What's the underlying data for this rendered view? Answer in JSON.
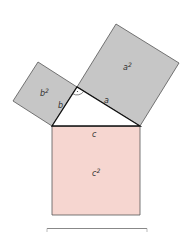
{
  "diagram": {
    "colors": {
      "leg_square_fill": "#c6c6c6",
      "hypotenuse_square_fill": "#f6d6d0",
      "stroke": "#555555",
      "triangle_stroke": "#111111",
      "bottom_line": "#888888"
    },
    "squares": [
      {
        "id": "a_square",
        "label": "a",
        "exponent": "2",
        "points": "77,87 140,126 179,63 116,24"
      },
      {
        "id": "b_square",
        "label": "b",
        "exponent": "2",
        "points": "52,126 77,87 38,62 13,101"
      },
      {
        "id": "c_square",
        "label": "c",
        "exponent": "2",
        "points": "52,126 140,126 140,215 52,215"
      }
    ],
    "triangle": {
      "vertices": "52,126 77,87 140,126",
      "side_labels": {
        "a": "a",
        "b": "b",
        "c": "c"
      },
      "right_angle_marker": "arc"
    },
    "labels": {
      "a_squared_base": "a",
      "a_squared_exp": "2",
      "b_squared_base": "b",
      "b_squared_exp": "2",
      "c_squared_base": "c",
      "c_squared_exp": "2",
      "side_a": "a",
      "side_b": "b",
      "side_c": "c"
    }
  }
}
